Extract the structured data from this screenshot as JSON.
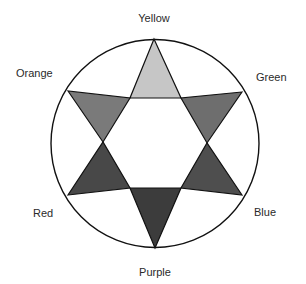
{
  "diagram": {
    "type": "color-wheel",
    "labels": {
      "yellow": "Yellow",
      "green": "Green",
      "blue": "Blue",
      "purple": "Purple",
      "red": "Red",
      "orange": "Orange"
    },
    "colors": {
      "yellow": "#c6c6c6",
      "green": "#6e6e6e",
      "blue": "#4e4e4e",
      "purple": "#3c3c3c",
      "red": "#484848",
      "orange": "#7a7a7a",
      "outline": "#111111"
    }
  }
}
